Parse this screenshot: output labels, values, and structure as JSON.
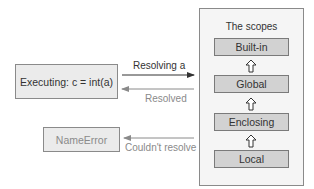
{
  "executing_box": {
    "label": "Executing: c = int(a)"
  },
  "error_box": {
    "label": "NameError"
  },
  "scopes_panel": {
    "title": "The scopes",
    "items": [
      {
        "label": "Built-in"
      },
      {
        "label": "Global"
      },
      {
        "label": "Enclosing"
      },
      {
        "label": "Local"
      }
    ],
    "connector_icon": "hollow-up-arrow"
  },
  "arrows": [
    {
      "label": "Resolving a",
      "direction": "right",
      "color": "#333333"
    },
    {
      "label": "Resolved",
      "direction": "left",
      "color": "#8a8a8a"
    },
    {
      "label": "Couldn't resolve",
      "direction": "left",
      "color": "#8a8a8a"
    }
  ],
  "colors": {
    "box_fill": "#ebebeb",
    "panel_fill": "#f5f5f5",
    "scope_fill": "#d2d2d2",
    "border": "#8a8a8a"
  }
}
